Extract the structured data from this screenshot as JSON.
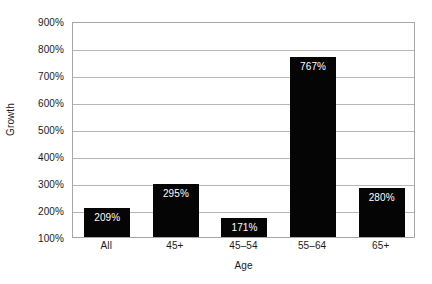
{
  "chart_data": {
    "type": "bar",
    "title": "",
    "xlabel": "Age",
    "ylabel": "Growth",
    "categories": [
      "All",
      "45+",
      "45–54",
      "55–64",
      "65+"
    ],
    "values": [
      209,
      295,
      171,
      767,
      280
    ],
    "value_labels": [
      "209%",
      "295%",
      "171%",
      "767%",
      "280%"
    ],
    "ylim": [
      100,
      900
    ],
    "yticks": [
      100,
      200,
      300,
      400,
      500,
      600,
      700,
      800,
      900
    ],
    "ytick_labels": [
      "100%",
      "200%",
      "300%",
      "400%",
      "500%",
      "600%",
      "700%",
      "800%",
      "900%"
    ],
    "grid": true,
    "legend": null,
    "bar_color": "#050505",
    "gridline_color": "#b4b4b4",
    "axis_color": "#a6a6a6",
    "label_text_color": "#ffffff",
    "background": "#ffffff"
  }
}
